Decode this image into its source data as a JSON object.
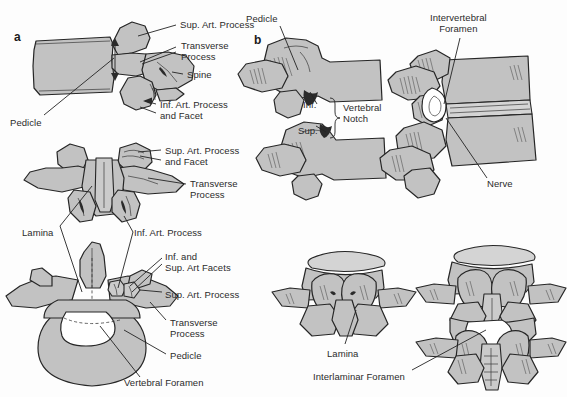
{
  "figure": {
    "background_color": "#fdfdfd",
    "bone_fill_color": "#c2c2c2",
    "bone_fill_color_light": "#cfcfcf",
    "bone_outline_color": "#2b2b2b",
    "foramen_fill_color": "#ffffff",
    "label_text_color": "#2b2b2b",
    "leader_line_color": "#222222"
  },
  "panels": [
    {
      "id": "a",
      "letter": "a",
      "x": 14,
      "y": 30
    },
    {
      "id": "b",
      "letter": "b",
      "x": 254,
      "y": 33
    }
  ],
  "labels": [
    {
      "id": "a-sup-art-process",
      "text": "Sup. Art. Process",
      "x": 180,
      "y": 20,
      "panel": "a"
    },
    {
      "id": "a-transverse-process",
      "text": "Transverse\nProcess",
      "x": 181,
      "y": 41,
      "panel": "a"
    },
    {
      "id": "a-spine",
      "text": "Spine",
      "x": 187,
      "y": 70,
      "panel": "a"
    },
    {
      "id": "a-inf-art-process-facet",
      "text": "Inf. Art. Process\nand Facet",
      "x": 160,
      "y": 100,
      "panel": "a"
    },
    {
      "id": "a-pedicle",
      "text": "Pedicle",
      "x": 10,
      "y": 118,
      "panel": "a"
    },
    {
      "id": "a2-sup-art-process-facet",
      "text": "Sup. Art. Process\nand Facet",
      "x": 165,
      "y": 146,
      "panel": "a"
    },
    {
      "id": "a2-transverse-process",
      "text": "Transverse\nProcess",
      "x": 190,
      "y": 179,
      "panel": "a"
    },
    {
      "id": "a2-lamina",
      "text": "Lamina",
      "x": 22,
      "y": 228,
      "panel": "a"
    },
    {
      "id": "a2-inf-art-process",
      "text": "Inf. Art. Process",
      "x": 134,
      "y": 228,
      "panel": "a"
    },
    {
      "id": "a3-inf-sup-art-facets",
      "text": "Inf. and\nSup. Art Facets",
      "x": 165,
      "y": 252,
      "panel": "a"
    },
    {
      "id": "a3-sup-art-process",
      "text": "Sup. Art. Process",
      "x": 165,
      "y": 290,
      "panel": "a"
    },
    {
      "id": "a3-transverse-process",
      "text": "Transverse\nProcess",
      "x": 170,
      "y": 318,
      "panel": "a"
    },
    {
      "id": "a3-pedicle",
      "text": "Pedicle",
      "x": 170,
      "y": 351,
      "panel": "a"
    },
    {
      "id": "a3-vertebral-foramen",
      "text": "Vertebral Foramen",
      "x": 124,
      "y": 378,
      "panel": "a"
    },
    {
      "id": "b-pedicle",
      "text": "Pedicle",
      "x": 246,
      "y": 14,
      "panel": "b"
    },
    {
      "id": "b-inf",
      "text": "Inf.",
      "x": 303,
      "y": 100,
      "panel": "b"
    },
    {
      "id": "b-sup",
      "text": "Sup.",
      "x": 298,
      "y": 126,
      "panel": "b"
    },
    {
      "id": "b-vertebral-notch",
      "text": "Vertebral\nNotch",
      "x": 337,
      "y": 105,
      "panel": "b"
    },
    {
      "id": "b-intervertebral-foramen",
      "text": "Intervertebral\nForamen",
      "x": 430,
      "y": 13,
      "panel": "b"
    },
    {
      "id": "b-nerve",
      "text": "Nerve",
      "x": 487,
      "y": 179,
      "panel": "b"
    },
    {
      "id": "b-lamina",
      "text": "Lamina",
      "x": 327,
      "y": 349,
      "panel": "b"
    },
    {
      "id": "b-interlaminar-foramen",
      "text": "Interlaminar Foramen",
      "x": 313,
      "y": 372,
      "panel": "b"
    }
  ],
  "icons": {
    "brace": "curly-brace-icon",
    "arrow": "arrowhead-icon"
  }
}
